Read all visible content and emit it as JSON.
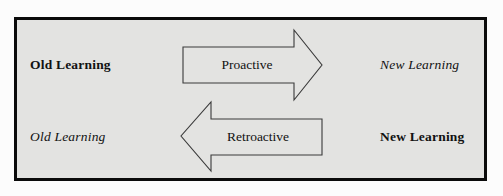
{
  "figure": {
    "name": "interference-diagram",
    "frame_color": "#0b0b0b",
    "interior_color": "#e3e3e1",
    "page_color": "#fcfcfc",
    "arrow_stroke_color": "#3a3a3a",
    "text_color": "#111111"
  },
  "rows": {
    "top": {
      "left_label": "Old Learning",
      "left_style": "bold",
      "arrow_label": "Proactive",
      "arrow_direction": "right",
      "right_label": "New Learning",
      "right_style": "italic"
    },
    "bottom": {
      "left_label": "Old Learning",
      "left_style": "italic",
      "arrow_label": "Retroactive",
      "arrow_direction": "left",
      "right_label": "New Learning",
      "right_style": "bold"
    }
  }
}
